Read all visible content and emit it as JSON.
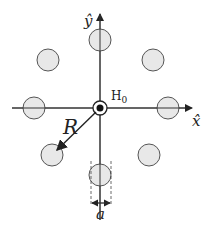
{
  "diagram": {
    "title": "",
    "labels": {
      "y_axis": "ŷ",
      "x_axis": "x̂",
      "center": "H",
      "center_sub": "0",
      "radius": "R",
      "diameter": "a"
    },
    "colors": {
      "circle_fill": "#e8e8e8",
      "circle_stroke": "#555555",
      "axis": "#333333",
      "background": "#ffffff"
    },
    "center": [
      100,
      108
    ],
    "ring_radius": 70,
    "circle_radius": 11,
    "circles_count": 8
  }
}
